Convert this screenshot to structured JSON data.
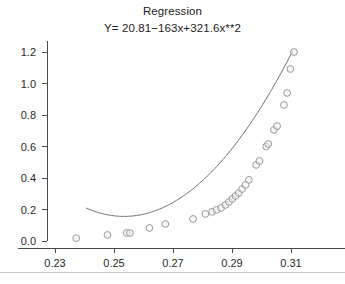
{
  "chart_data": {
    "type": "scatter",
    "title": "Regression",
    "subtitle": "Y= 20.81−163x+321.6x**2",
    "xlabel": "",
    "ylabel": "",
    "xlim": [
      0.2215,
      0.3175
    ],
    "ylim": [
      -0.045,
      1.27
    ],
    "grid": false,
    "legend": null,
    "xticks": [
      0.23,
      0.25,
      0.27,
      0.29,
      0.31
    ],
    "xtick_labels": [
      "0.23",
      "0.25",
      "0.27",
      "0.29",
      "0.31"
    ],
    "yticks": [
      0.0,
      0.2,
      0.4,
      0.6,
      0.8,
      1.0,
      1.2
    ],
    "ytick_labels": [
      "0.0",
      "0.2",
      "0.4",
      "0.6",
      "0.8",
      "1.0",
      "1.2"
    ],
    "marker": "open-circle",
    "marker_color": "#9a9a9a",
    "curve_color": "#6e6e6e",
    "fit": {
      "equation": "Y= 20.81−163x+321.6x**2",
      "intercept": 20.81,
      "linear_coefficient": -163,
      "quadratic_coefficient": 321.6,
      "x_start": 0.2405,
      "x_end": 0.3105
    },
    "x": [
      0.2372,
      0.2478,
      0.2543,
      0.2554,
      0.262,
      0.2674,
      0.2768,
      0.281,
      0.2833,
      0.2848,
      0.2863,
      0.2878,
      0.289,
      0.2901,
      0.2912,
      0.2923,
      0.2934,
      0.2946,
      0.2957,
      0.2982,
      0.2993,
      0.3016,
      0.3023,
      0.3042,
      0.3053,
      0.3076,
      0.3087,
      0.3098,
      0.311
    ],
    "y": [
      0.018,
      0.038,
      0.051,
      0.051,
      0.083,
      0.108,
      0.14,
      0.172,
      0.185,
      0.198,
      0.21,
      0.229,
      0.248,
      0.267,
      0.286,
      0.305,
      0.33,
      0.356,
      0.388,
      0.483,
      0.508,
      0.6,
      0.616,
      0.705,
      0.73,
      0.864,
      0.94,
      1.092,
      1.2
    ],
    "series": [
      {
        "name": "observations",
        "x": [
          0.2372,
          0.2478,
          0.2543,
          0.2554,
          0.262,
          0.2674,
          0.2768,
          0.281,
          0.2833,
          0.2848,
          0.2863,
          0.2878,
          0.289,
          0.2901,
          0.2912,
          0.2923,
          0.2934,
          0.2946,
          0.2957,
          0.2982,
          0.2993,
          0.3016,
          0.3023,
          0.3042,
          0.3053,
          0.3076,
          0.3087,
          0.3098,
          0.311
        ],
        "y": [
          0.018,
          0.038,
          0.051,
          0.051,
          0.083,
          0.108,
          0.14,
          0.172,
          0.185,
          0.198,
          0.21,
          0.229,
          0.248,
          0.267,
          0.286,
          0.305,
          0.33,
          0.356,
          0.388,
          0.483,
          0.508,
          0.6,
          0.616,
          0.705,
          0.73,
          0.864,
          0.94,
          1.092,
          1.2
        ]
      }
    ]
  }
}
